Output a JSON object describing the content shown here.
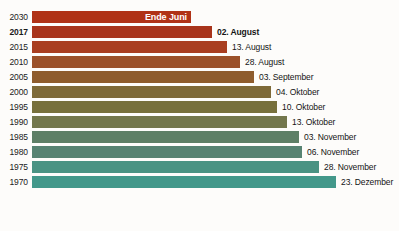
{
  "chart_data": {
    "type": "bar",
    "title": "",
    "xlabel": "",
    "ylabel": "",
    "orientation": "horizontal",
    "grid": false,
    "legend": false,
    "categories": [
      "2030",
      "2017",
      "2015",
      "2010",
      "2005",
      "2000",
      "1995",
      "1990",
      "1985",
      "1980",
      "1975",
      "1970"
    ],
    "value_labels": [
      "Ende Juni",
      "02. August",
      "13. August",
      "28. August",
      "03. September",
      "04. Oktober",
      "10. Oktober",
      "13. Oktober",
      "03. November",
      "06. November",
      "28. November",
      "23. Dezember"
    ],
    "values": [
      181,
      214,
      225,
      240,
      246,
      277,
      283,
      286,
      307,
      310,
      332,
      357
    ],
    "value_unit": "day-of-year",
    "bar_colors": [
      "#b03216",
      "#a8341b",
      "#a93e20",
      "#9b512a",
      "#8e5c2d",
      "#7e6a38",
      "#77703c",
      "#73774c",
      "#5e7f66",
      "#578372",
      "#4a9383",
      "#43988a"
    ],
    "bars": [
      {
        "year": "2030",
        "date": "Ende Juni",
        "bar_end_px": 192,
        "color": "#b03216",
        "label_inside": true,
        "bold": true
      },
      {
        "year": "2017",
        "date": "02. August",
        "bar_end_px": 213,
        "color": "#a8341b",
        "label_inside": false,
        "bold": true
      },
      {
        "year": "2015",
        "date": "13. August",
        "bar_end_px": 228,
        "color": "#a93e20",
        "label_inside": false,
        "bold": false
      },
      {
        "year": "2010",
        "date": "28. August",
        "bar_end_px": 241,
        "color": "#9b512a",
        "label_inside": false,
        "bold": false
      },
      {
        "year": "2005",
        "date": "03. September",
        "bar_end_px": 255,
        "color": "#8e5c2d",
        "label_inside": false,
        "bold": false
      },
      {
        "year": "2000",
        "date": "04. Oktober",
        "bar_end_px": 272,
        "color": "#7e6a38",
        "label_inside": false,
        "bold": false
      },
      {
        "year": "1995",
        "date": "10. Oktober",
        "bar_end_px": 278,
        "color": "#77703c",
        "label_inside": false,
        "bold": false
      },
      {
        "year": "1990",
        "date": "13. Oktober",
        "bar_end_px": 288,
        "color": "#73774c",
        "label_inside": false,
        "bold": false
      },
      {
        "year": "1985",
        "date": "03. November",
        "bar_end_px": 300,
        "color": "#5e7f66",
        "label_inside": false,
        "bold": false
      },
      {
        "year": "1980",
        "date": "06. November",
        "bar_end_px": 303,
        "color": "#578372",
        "label_inside": false,
        "bold": false
      },
      {
        "year": "1975",
        "date": "28. November",
        "bar_end_px": 320,
        "color": "#4a9383",
        "label_inside": false,
        "bold": false
      },
      {
        "year": "1970",
        "date": "23. Dezember",
        "bar_end_px": 337,
        "color": "#43988a",
        "label_inside": false,
        "bold": false
      }
    ]
  }
}
